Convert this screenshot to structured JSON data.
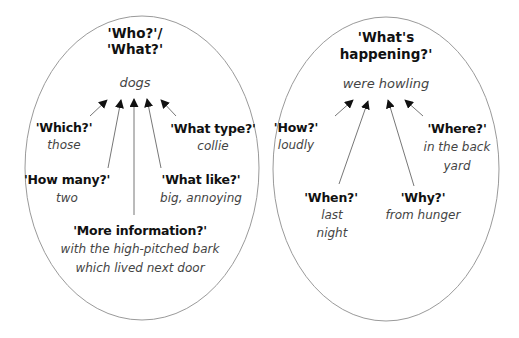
{
  "left_diagram": {
    "heading_line1": "'Who?'/",
    "heading_line2": "'What?'",
    "core": "dogs",
    "modifiers": [
      {
        "question": "'Which?'",
        "answer": "those"
      },
      {
        "question": "'What type?'",
        "answer": "collie"
      },
      {
        "question": "'How many?'",
        "answer": "two"
      },
      {
        "question": "'What like?'",
        "answer": "big, annoying"
      },
      {
        "question": "'More information?'",
        "answer_line1": "with the high-pitched bark",
        "answer_line2": "which lived next door"
      }
    ]
  },
  "right_diagram": {
    "heading_line1": "'What's",
    "heading_line2": "happening?'",
    "core": "were howling",
    "modifiers": [
      {
        "question": "'How?'",
        "answer": "loudly"
      },
      {
        "question": "'Where?'",
        "answer_line1": "in the back",
        "answer_line2": "yard"
      },
      {
        "question": "'When?'",
        "answer_line1": "last",
        "answer_line2": "night"
      },
      {
        "question": "'Why?'",
        "answer": "from hunger"
      }
    ]
  },
  "colors": {
    "outline": "#9a9a9a",
    "arrow": "#777777",
    "arrowhead": "#111111",
    "question_text": "#111111",
    "answer_text": "#444444"
  }
}
